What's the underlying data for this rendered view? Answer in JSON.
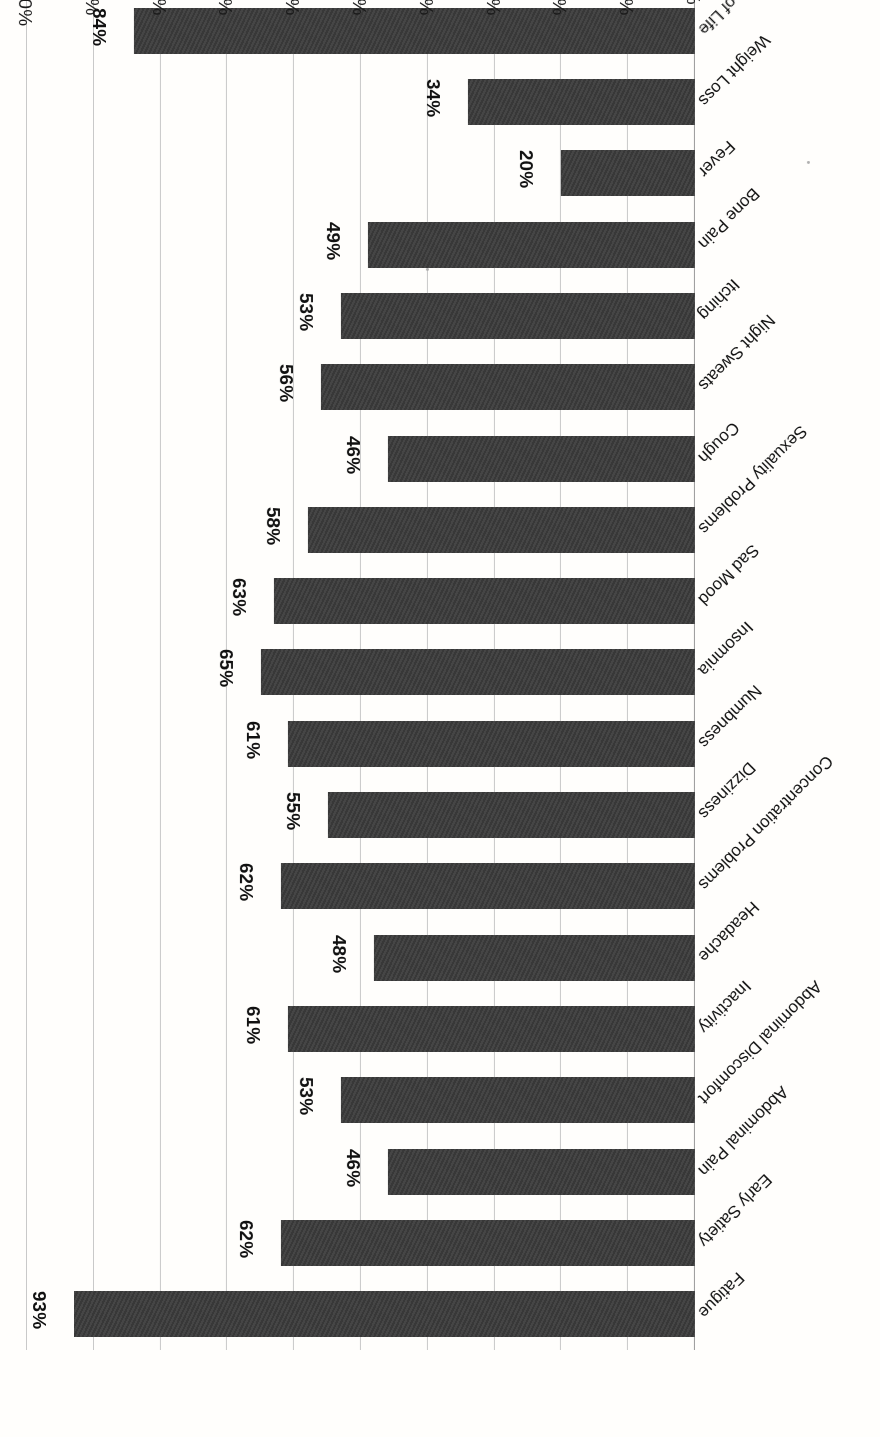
{
  "chart_data": {
    "type": "bar",
    "orientation": "horizontal",
    "title": "",
    "xlabel": "",
    "ylabel": "",
    "xlim": [
      0,
      100
    ],
    "xticks": [
      "0%",
      "10%",
      "20%",
      "30%",
      "40%",
      "50%",
      "60%",
      "70%",
      "80%",
      "90%",
      "100%"
    ],
    "grid": true,
    "legend": "none",
    "value_suffix": "%",
    "bar_color": "#3b3b3b",
    "gridline_color": "#c9c9c9",
    "background_color": "#fffefc",
    "page_rotation_degrees": 180,
    "categories": [
      "Fatigue",
      "Early Satiety",
      "Abdominal Pain",
      "Abdominal Discomfort",
      "Inactivity",
      "Headache",
      "Concentration Problems",
      "Dizziness",
      "Numbness",
      "Insomnia",
      "Sad Mood",
      "Sexuality Problems",
      "Cough",
      "Night Sweats",
      "Itching",
      "Bone Pain",
      "Fever",
      "Weight Loss",
      "Impaired Quality of Life"
    ],
    "values": [
      93,
      62,
      46,
      53,
      61,
      48,
      62,
      55,
      61,
      65,
      63,
      58,
      46,
      56,
      53,
      49,
      20,
      34,
      84
    ],
    "value_labels": [
      "93%",
      "62%",
      "46%",
      "53%",
      "61%",
      "48%",
      "62%",
      "55%",
      "61%",
      "65%",
      "63%",
      "58%",
      "46%",
      "56%",
      "53%",
      "49%",
      "20%",
      "34%",
      "84%"
    ]
  }
}
